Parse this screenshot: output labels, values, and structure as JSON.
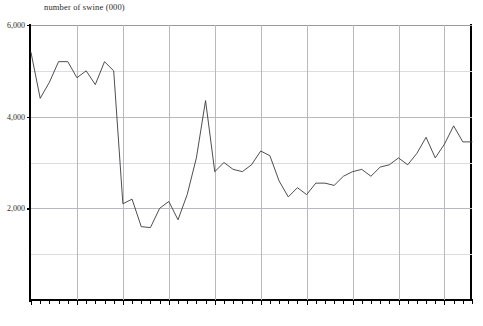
{
  "chart_data": {
    "type": "line",
    "title": "number of swine (000)",
    "xlabel": "",
    "ylabel": "",
    "ylim": [
      0,
      6000
    ],
    "xlim": [
      1925,
      1973
    ],
    "grid": true,
    "legend": false,
    "y_ticks": [
      {
        "value": 6000,
        "label": "6,000",
        "major": true
      },
      {
        "value": 5000,
        "label": "",
        "major": false
      },
      {
        "value": 4000,
        "label": "4,000",
        "major": true
      },
      {
        "value": 3000,
        "label": "",
        "major": false
      },
      {
        "value": 2000,
        "label": "2,000",
        "major": true
      },
      {
        "value": 1000,
        "label": "",
        "major": false
      }
    ],
    "x_ticks": [
      {
        "value": 1925,
        "label": "1925",
        "major": true
      },
      {
        "value": 1930,
        "label": "1930",
        "major": true
      },
      {
        "value": 1935,
        "label": "",
        "major": true
      },
      {
        "value": 1940,
        "label": "1940",
        "major": true
      },
      {
        "value": 1945,
        "label": "",
        "major": true
      },
      {
        "value": 1950,
        "label": "1950",
        "major": true
      },
      {
        "value": 1955,
        "label": "",
        "major": true
      },
      {
        "value": 1960,
        "label": "1960",
        "major": true
      },
      {
        "value": 1965,
        "label": "",
        "major": true
      },
      {
        "value": 1970,
        "label": "1970",
        "major": true
      }
    ],
    "series": [
      {
        "name": "number of swine (000)",
        "x": [
          1925,
          1926,
          1927,
          1928,
          1929,
          1930,
          1931,
          1932,
          1933,
          1934,
          1935,
          1936,
          1937,
          1938,
          1939,
          1940,
          1941,
          1942,
          1943,
          1944,
          1945,
          1946,
          1947,
          1948,
          1949,
          1950,
          1951,
          1952,
          1953,
          1954,
          1955,
          1956,
          1957,
          1958,
          1959,
          1960,
          1961,
          1962,
          1963,
          1964,
          1965,
          1966,
          1967,
          1968,
          1969,
          1970,
          1971,
          1972,
          1973
        ],
        "values": [
          5400,
          4400,
          4750,
          5200,
          5200,
          4850,
          5000,
          4700,
          5200,
          5000,
          2100,
          2200,
          1600,
          1580,
          2000,
          2150,
          1750,
          2300,
          3100,
          4350,
          2800,
          3000,
          2850,
          2800,
          2950,
          3250,
          3150,
          2600,
          2250,
          2450,
          2300,
          2550,
          2550,
          2500,
          2700,
          2800,
          2850,
          2700,
          2900,
          2950,
          3100,
          2950,
          3200,
          3550,
          3100,
          3400,
          3800,
          3450,
          3450
        ]
      }
    ]
  }
}
